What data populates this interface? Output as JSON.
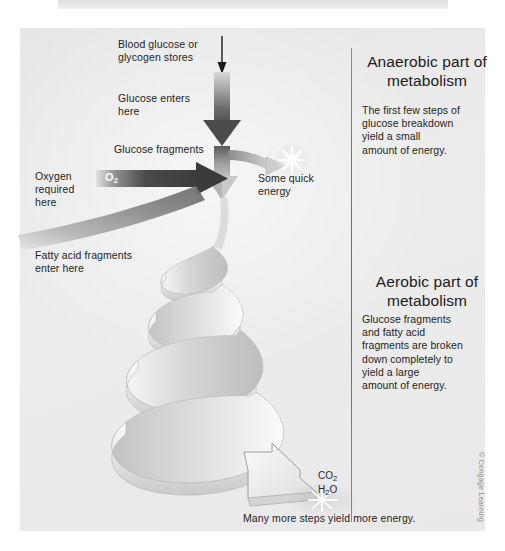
{
  "figure": {
    "title_strip": "",
    "background_color": "#ebebeb",
    "panel_color": "#ebebeb",
    "divider_color": "#777777"
  },
  "left_labels": {
    "blood_glucose": "Blood glucose or\nglycogen stores",
    "glucose_enters": "Glucose enters\nhere",
    "glucose_fragments": "Glucose fragments",
    "oxygen_required": "Oxygen\nrequired\nhere",
    "oxygen_symbol": "O",
    "oxygen_symbol_sub": "2",
    "fatty_acid": "Fatty acid fragments\nenter here"
  },
  "center_labels": {
    "some_quick_energy": "Some quick\nenergy",
    "co2": "CO",
    "co2_sub": "2",
    "h2o": "H",
    "h2o_sub": "2",
    "h2o_tail": "O",
    "bottom_caption": "Many more steps yield more energy."
  },
  "sections": [
    {
      "id": "anaerobic",
      "title": "Anaerobic part\nof metabolism",
      "body": "The first few steps of\nglucose breakdown\nyield a small\namount of energy."
    },
    {
      "id": "aerobic",
      "title": "Aerobic part of\nmetabolism",
      "body": "Glucose fragments\nand fatty acid\nfragments are broken\ndown completely to\nyield a large\namount of energy."
    }
  ],
  "credit": "© Cengage Learning"
}
